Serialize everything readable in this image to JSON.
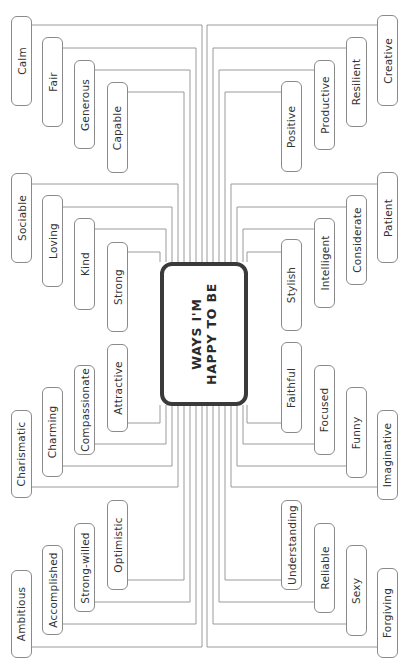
{
  "center": {
    "line1": "WAYS I'M",
    "line2": "HAPPY TO BE"
  },
  "colors": {
    "line": "#9a9a9a",
    "box_border": "#8a8a8a",
    "center_border": "#3a3a3a",
    "text": "#333333"
  },
  "left": {
    "group_top": [
      "Calm",
      "Fair",
      "Generous",
      "Capable"
    ],
    "group_upper_mid": [
      "Sociable",
      "Loving",
      "Kind",
      "Strong"
    ],
    "group_lower_mid": [
      "Charismatic",
      "Charming",
      "Compassionate",
      "Attractive"
    ],
    "group_bottom": [
      "Ambitious",
      "Accomplished",
      "Strong-willed",
      "Optimistic"
    ]
  },
  "right": {
    "group_top": [
      "Creative",
      "Resilient",
      "Productive",
      "Positive"
    ],
    "group_upper_mid": [
      "Patient",
      "Considerate",
      "Intelligent",
      "Stylish"
    ],
    "group_lower_mid": [
      "Imaginative",
      "Funny",
      "Focused",
      "Faithful"
    ],
    "group_bottom": [
      "Forgiving",
      "Sexy",
      "Reliable",
      "Understanding"
    ]
  }
}
